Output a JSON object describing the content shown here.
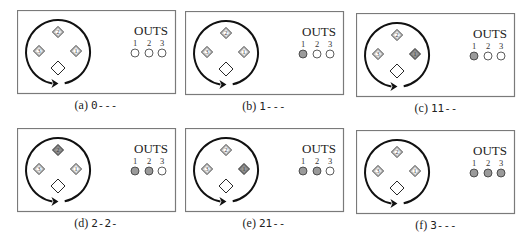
{
  "figure": {
    "outs_title": "OUTS",
    "out_labels": [
      "1",
      "2",
      "3"
    ],
    "colors": {
      "border": "#7a7a7a",
      "stroke": "#111111",
      "filled": "#9a9a9a",
      "empty": "#ffffff"
    },
    "diamond_labels": {
      "top": "2",
      "left": "3",
      "right": "1",
      "bottom": ""
    },
    "panels": [
      {
        "id": "a",
        "label": "(a)",
        "code": "0---",
        "filled_diamond": null,
        "outs": [
          false,
          false,
          false
        ]
      },
      {
        "id": "b",
        "label": "(b)",
        "code": "1---",
        "filled_diamond": null,
        "outs": [
          true,
          false,
          false
        ]
      },
      {
        "id": "c",
        "label": "(c)",
        "code": "11--",
        "filled_diamond": "right",
        "outs": [
          true,
          false,
          false
        ]
      },
      {
        "id": "d",
        "label": "(d)",
        "code": "2-2-",
        "filled_diamond": "top",
        "outs": [
          true,
          true,
          false
        ]
      },
      {
        "id": "e",
        "label": "(e)",
        "code": "21--",
        "filled_diamond": "right",
        "outs": [
          true,
          true,
          false
        ]
      },
      {
        "id": "f",
        "label": "(f)",
        "code": "3---",
        "filled_diamond": null,
        "outs": [
          true,
          true,
          true
        ]
      }
    ]
  }
}
